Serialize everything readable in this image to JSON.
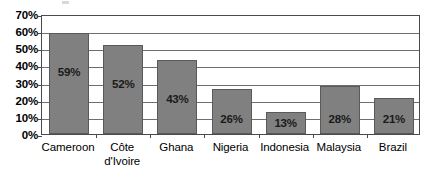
{
  "chart_data": {
    "type": "bar",
    "title": "",
    "subtitle": "",
    "xlabel": "",
    "ylabel": "",
    "categories": [
      "Cameroon",
      "Côte d'Ivoire",
      "Ghana",
      "Nigeria",
      "Indonesia",
      "Malaysia",
      "Brazil"
    ],
    "values": [
      59,
      52,
      43,
      26,
      13,
      28,
      21
    ],
    "data_labels": [
      "59%",
      "52%",
      "43%",
      "26%",
      "13%",
      "28%",
      "21%"
    ],
    "ylim": [
      0,
      70
    ],
    "ytick_values": [
      0,
      10,
      20,
      30,
      40,
      50,
      60,
      70
    ],
    "ytick_labels": [
      "0%",
      "10%",
      "20%",
      "30%",
      "40%",
      "50%",
      "60%",
      "70%"
    ],
    "grid": true,
    "legend": false,
    "legend_position": "none",
    "bar_color": "#808080",
    "bar_border_color": "#5a5a5a",
    "gridline_color": "#6e6e6e",
    "axis_color": "#4a4a4a",
    "background_color": "#ffffff",
    "text_color": "#000000"
  },
  "axis": {
    "y_labels": [
      "70%",
      "60%",
      "50%",
      "40%",
      "30%",
      "20%",
      "10%",
      "0%"
    ],
    "x_labels": [
      {
        "line1": "Cameroon",
        "line2": ""
      },
      {
        "line1": "Côte",
        "line2": "d'Ivoire"
      },
      {
        "line1": "Ghana",
        "line2": ""
      },
      {
        "line1": "Nigeria",
        "line2": ""
      },
      {
        "line1": "Indonesia",
        "line2": ""
      },
      {
        "line1": "Malaysia",
        "line2": ""
      },
      {
        "line1": "Brazil",
        "line2": ""
      }
    ]
  },
  "bars": [
    {
      "label": "Cameroon",
      "value": 59,
      "display": "59%"
    },
    {
      "label": "Côte d'Ivoire",
      "value": 52,
      "display": "52%"
    },
    {
      "label": "Ghana",
      "value": 43,
      "display": "43%"
    },
    {
      "label": "Nigeria",
      "value": 26,
      "display": "26%"
    },
    {
      "label": "Indonesia",
      "value": 13,
      "display": "13%"
    },
    {
      "label": "Malaysia",
      "value": 28,
      "display": "28%"
    },
    {
      "label": "Brazil",
      "value": 21,
      "display": "21%"
    }
  ]
}
